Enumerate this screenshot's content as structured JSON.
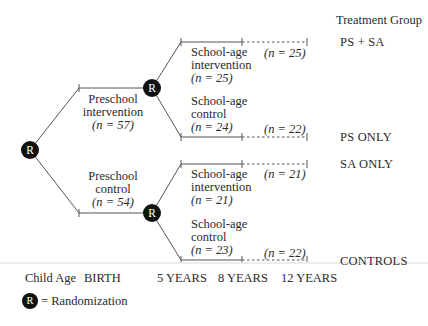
{
  "header": {
    "treatment_group_title": "Treatment Group"
  },
  "node_label": "R",
  "branches": {
    "preschool_intervention": {
      "line1": "Preschool",
      "line2": "intervention",
      "n": "(n = 57)"
    },
    "preschool_control": {
      "line1": "Preschool",
      "line2": "control",
      "n": "(n = 54)"
    },
    "sa_int_upper": {
      "line1": "School-age",
      "line2": "intervention",
      "n": "(n = 25)"
    },
    "sa_ctrl_upper": {
      "line1": "School-age",
      "line2": "control",
      "n": "(n = 24)"
    },
    "sa_int_lower": {
      "line1": "School-age",
      "line2": "intervention",
      "n": "(n = 21)"
    },
    "sa_ctrl_lower": {
      "line1": "School-age",
      "line2": "control",
      "n": "(n = 23)"
    }
  },
  "followup": [
    "(n = 25)",
    "(n = 22)",
    "(n = 21)",
    "(n = 22)"
  ],
  "groups": [
    "PS + SA",
    "PS ONLY",
    "SA ONLY",
    "CONTROLS"
  ],
  "axis": {
    "label": "Child Age",
    "ticks": [
      "BIRTH",
      "5 YEARS",
      "8 YEARS",
      "12 YEARS"
    ]
  },
  "legend": {
    "symbol": "R",
    "text": "= Randomization"
  }
}
